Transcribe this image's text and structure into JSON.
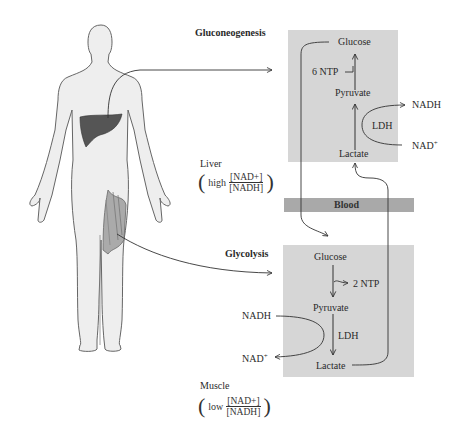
{
  "gluconeogenesis": {
    "title": "Gluconeogenesis",
    "glucose": "Glucose",
    "ntp": "6 NTP",
    "pyruvate": "Pyruvate",
    "nadh": "NADH",
    "ldh": "LDH",
    "nad": "NAD",
    "nad_sup": "+",
    "lactate": "Lactate"
  },
  "liver": {
    "label": "Liver",
    "ratio_word": "high",
    "numerator": "[NAD+]",
    "denominator": "[NADH]"
  },
  "blood": {
    "label": "Blood"
  },
  "glycolysis": {
    "title": "Glycolysis",
    "glucose": "Glucose",
    "ntp": "2 NTP",
    "pyruvate": "Pyruvate",
    "nadh": "NADH",
    "ldh": "LDH",
    "nad": "NAD",
    "nad_sup": "+",
    "lactate": "Lactate"
  },
  "muscle": {
    "label": "Muscle",
    "ratio_word": "low",
    "numerator": "[NAD+]",
    "denominator": "[NADH]"
  },
  "colors": {
    "box": "#d6d6d6",
    "blood": "#a9a9a9",
    "liver": "#555555",
    "body": "#eeeeee",
    "body_outline": "#666666"
  }
}
